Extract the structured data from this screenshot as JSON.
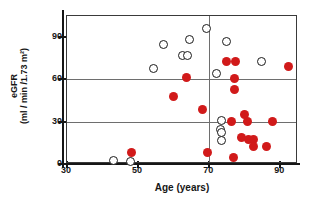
{
  "chart_data": {
    "type": "scatter",
    "title": "",
    "xlabel": "Age (years)",
    "ylabel_line1": "eGFR",
    "ylabel_line2": "(ml / min /1.73 m²)",
    "xlim": [
      30,
      95
    ],
    "ylim": [
      0,
      105
    ],
    "xticks": [
      30,
      50,
      70,
      90
    ],
    "yticks": [
      0,
      30,
      60,
      90
    ],
    "xticklabels": [
      "30",
      "50",
      "70",
      "90"
    ],
    "yticklabels": [
      "0",
      "30",
      "60",
      "90"
    ],
    "grid": "horizontal lines at eGFR 30 and 60; vertical line at Age 70",
    "gridlines_h": [
      30,
      60
    ],
    "gridlines_v": [
      70
    ],
    "grid_color": "#6e6e6e",
    "frame_color": "#3a3a3a",
    "legend": "none",
    "series": [
      {
        "name": "filled",
        "marker": "filled-circle",
        "color": "#D11A1A",
        "points": [
          {
            "x": 48.2,
            "y": 8
          },
          {
            "x": 60.0,
            "y": 48
          },
          {
            "x": 63.5,
            "y": 61.5
          },
          {
            "x": 68.0,
            "y": 38.5
          },
          {
            "x": 69.6,
            "y": 8.5
          },
          {
            "x": 75.0,
            "y": 73
          },
          {
            "x": 77.4,
            "y": 73
          },
          {
            "x": 77.0,
            "y": 60.5
          },
          {
            "x": 77.2,
            "y": 53
          },
          {
            "x": 76.3,
            "y": 30.5
          },
          {
            "x": 76.8,
            "y": 4.5
          },
          {
            "x": 80.0,
            "y": 35
          },
          {
            "x": 80.8,
            "y": 30.5
          },
          {
            "x": 79.0,
            "y": 19
          },
          {
            "x": 81.0,
            "y": 17.5
          },
          {
            "x": 82.6,
            "y": 17.5
          },
          {
            "x": 82.6,
            "y": 12.5
          },
          {
            "x": 86.2,
            "y": 12.5
          },
          {
            "x": 87.8,
            "y": 30.5
          },
          {
            "x": 92.2,
            "y": 69.5
          }
        ]
      },
      {
        "name": "open",
        "marker": "open-circle",
        "color": "#1b1b1b",
        "points": [
          {
            "x": 43.2,
            "y": 2.5
          },
          {
            "x": 48.0,
            "y": 2.0
          },
          {
            "x": 54.2,
            "y": 68
          },
          {
            "x": 57.2,
            "y": 85
          },
          {
            "x": 62.4,
            "y": 77
          },
          {
            "x": 64.0,
            "y": 77
          },
          {
            "x": 64.6,
            "y": 88.5
          },
          {
            "x": 69.3,
            "y": 96
          },
          {
            "x": 72.2,
            "y": 64.5
          },
          {
            "x": 75.0,
            "y": 87
          },
          {
            "x": 73.5,
            "y": 31
          },
          {
            "x": 73.1,
            "y": 24.5
          },
          {
            "x": 73.4,
            "y": 22.5
          },
          {
            "x": 73.5,
            "y": 16.5
          },
          {
            "x": 84.8,
            "y": 72.5
          }
        ]
      }
    ]
  },
  "axes": {
    "x_title": "Age (years)",
    "y_title_line1": "eGFR",
    "y_title_line2": "(ml / min /1.73 m²)"
  }
}
